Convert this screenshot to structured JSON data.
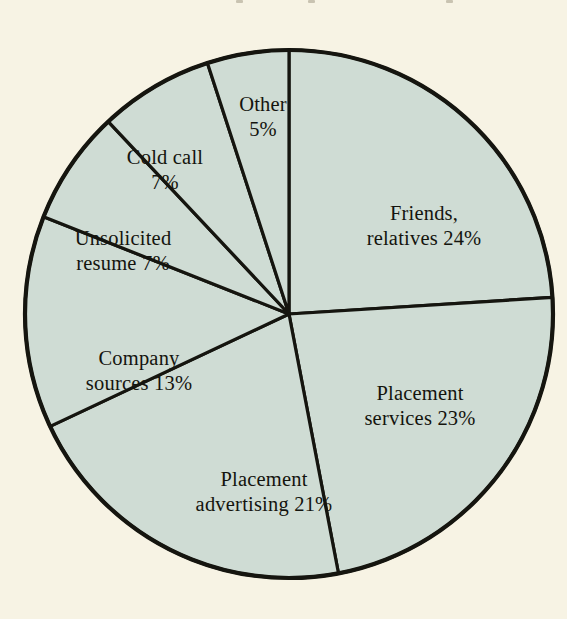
{
  "figure": {
    "background_color": "#f7f3e4",
    "slice_fill_color": "#cfdcd4",
    "line_color": "#15150f"
  },
  "chart_data": {
    "type": "pie",
    "title": "",
    "subtitle": "",
    "xlabel": "",
    "ylabel": "",
    "legend": "none",
    "grid": false,
    "start_angle_deg": 0,
    "direction": "clockwise",
    "units": "percent",
    "categories": [
      "Friends, relatives",
      "Placement services",
      "Placement advertising",
      "Company sources",
      "Unsolicited resume",
      "Cold call",
      "Other"
    ],
    "values": [
      24,
      23,
      21,
      13,
      7,
      7,
      5
    ],
    "slices": [
      {
        "name": "Friends, relatives",
        "value": 24,
        "value_text": "24%",
        "label_lines": [
          "Friends,",
          "relatives  24%"
        ],
        "label_x": 424,
        "label_y": 226
      },
      {
        "name": "Placement services",
        "value": 23,
        "value_text": "23%",
        "label_lines": [
          "Placement",
          "services  23%"
        ],
        "label_x": 420,
        "label_y": 406
      },
      {
        "name": "Placement advertising",
        "value": 21,
        "value_text": "21%",
        "label_lines": [
          "Placement",
          "advertising  21%"
        ],
        "label_x": 264,
        "label_y": 492
      },
      {
        "name": "Company sources",
        "value": 13,
        "value_text": "13%",
        "label_lines": [
          "Company",
          "sources  13%"
        ],
        "label_x": 139,
        "label_y": 371
      },
      {
        "name": "Unsolicited resume",
        "value": 7,
        "value_text": "7%",
        "label_lines": [
          "Unsolicited",
          "resume    7%"
        ],
        "label_x": 123,
        "label_y": 251
      },
      {
        "name": "Cold call",
        "value": 7,
        "value_text": "7%",
        "label_lines": [
          "Cold call",
          "7%"
        ],
        "label_x": 165,
        "label_y": 170
      },
      {
        "name": "Other",
        "value": 5,
        "value_text": "5%",
        "label_lines": [
          "Other",
          "5%"
        ],
        "label_x": 263,
        "label_y": 117
      }
    ]
  }
}
